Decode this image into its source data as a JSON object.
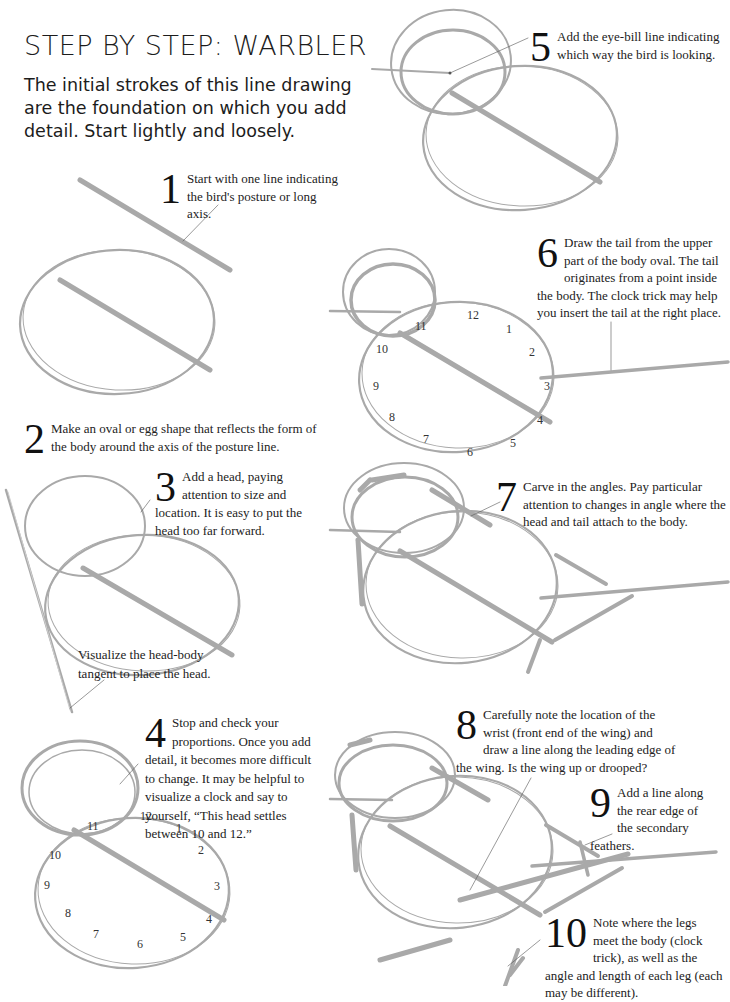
{
  "header": {
    "title": "STEP BY STEP: WARBLER",
    "intro": "The initial strokes of this line drawing are the foundation on which you add detail. Start lightly and loosely."
  },
  "colors": {
    "stroke": "#a9a9a9",
    "text": "#1c1c1c",
    "background": "#ffffff"
  },
  "steps": [
    {
      "number": "1",
      "text": "Start with one line indicating the bird's posture or long axis."
    },
    {
      "number": "2",
      "text": "Make an oval or egg shape that reflects the form of the body around the axis of the posture line."
    },
    {
      "number": "3",
      "text": "Add a head, paying attention to size and location. It is easy to put the head too far forward."
    },
    {
      "number": "4",
      "text": "Stop and check your proportions. Once you add detail, it becomes more difficult to change. It may be helpful to visualize a clock and say to yourself, “This head settles between 10 and 12.”"
    },
    {
      "number": "5",
      "text": "Add the eye-bill line indicating which way the bird is looking."
    },
    {
      "number": "6",
      "text": "Draw the tail from the upper part of the body oval. The tail originates from a point inside the body. The clock trick may help you insert the tail at the right place."
    },
    {
      "number": "7",
      "text": "Carve in the angles. Pay particular attention to changes in angle where the head and tail attach to the body."
    },
    {
      "number": "8",
      "text": "Carefully note the location of the wrist (front end of the wing) and draw a line along the leading edge of the wing. Is the wing up or drooped?"
    },
    {
      "number": "9",
      "text": "Add a line along the rear edge of the secondary feathers."
    },
    {
      "number": "10",
      "text": "Note where the legs meet the body (clock trick), as well as the angle and length of each leg (each may be different)."
    }
  ],
  "notes": {
    "tangent": "Visualize the head-body tangent to place the head."
  },
  "clock_labels": [
    "12",
    "1",
    "2",
    "3",
    "4",
    "5",
    "6",
    "7",
    "8",
    "9",
    "10",
    "11"
  ]
}
